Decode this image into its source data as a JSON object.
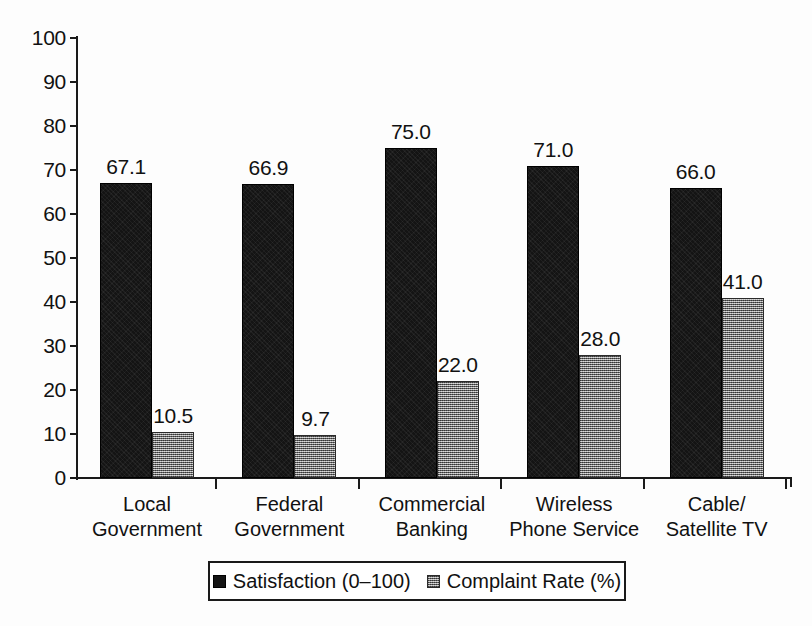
{
  "chart_data": {
    "type": "bar",
    "title": "",
    "subtitle": "",
    "xlabel": "",
    "ylabel": "",
    "ylim": [
      0,
      100
    ],
    "ytick_step": 10,
    "yticks": [
      "0",
      "10",
      "20",
      "30",
      "40",
      "50",
      "60",
      "70",
      "80",
      "90",
      "100"
    ],
    "grid": false,
    "legend_position": "bottom",
    "categories": [
      "Local\nGovernment",
      "Federal\nGovernment",
      "Commercial\nBanking",
      "Wireless\nPhone Service",
      "Cable/\nSatellite TV"
    ],
    "series": [
      {
        "name": "Satisfaction (0–100)",
        "color": "#141414",
        "values": [
          67.1,
          66.9,
          75.0,
          71.0,
          66.0
        ],
        "labels": [
          "67.1",
          "66.9",
          "75.0",
          "71.0",
          "66.0"
        ]
      },
      {
        "name": "Complaint Rate (%)",
        "color": "#8d8d8d",
        "values": [
          10.5,
          9.7,
          22.0,
          28.0,
          41.0
        ],
        "labels": [
          "10.5",
          "9.7",
          "22.0",
          "28.0",
          "41.0"
        ]
      }
    ]
  },
  "legend": {
    "entries": [
      {
        "label": "Satisfaction (0–100)",
        "swatch": "dark-square-icon"
      },
      {
        "label": "Complaint Rate (%)",
        "swatch": "gray-square-icon"
      }
    ]
  }
}
